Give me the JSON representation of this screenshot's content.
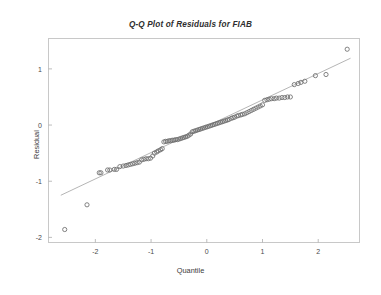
{
  "figure": {
    "title": "Q-Q Plot of Residuals for FIAB",
    "background_color": "#ffffff",
    "frame_color": "#c8c8c8",
    "marker_color": "#6d6d6d",
    "line_color": "#a8a8a8"
  },
  "axes": {
    "x_title": "Quantile",
    "y_title": "Residual",
    "x_ticks": [
      "-2",
      "-1",
      "0",
      "1",
      "2"
    ],
    "y_ticks": [
      "1",
      "0",
      "-1",
      "-2"
    ]
  },
  "chart_data": {
    "type": "scatter",
    "title": "Q-Q Plot of Residuals for FIAB",
    "xlabel": "Quantile",
    "ylabel": "Residual",
    "xlim": [
      -2.85,
      2.75
    ],
    "ylim": [
      -2.1,
      1.55
    ],
    "xticks": [
      -2,
      -1,
      0,
      1,
      2
    ],
    "yticks": [
      1,
      0,
      -1,
      -2
    ],
    "grid": false,
    "legend": null,
    "series": [
      {
        "name": "Residual quantiles",
        "marker": "open-circle",
        "x": [
          -2.55,
          -2.15,
          -1.93,
          -1.9,
          -1.78,
          -1.74,
          -1.66,
          -1.62,
          -1.56,
          -1.5,
          -1.45,
          -1.41,
          -1.37,
          -1.33,
          -1.29,
          -1.25,
          -1.21,
          -1.17,
          -1.13,
          -1.09,
          -1.05,
          -1.01,
          -0.97,
          -0.94,
          -0.9,
          -0.87,
          -0.83,
          -0.8,
          -0.77,
          -0.74,
          -0.71,
          -0.68,
          -0.65,
          -0.62,
          -0.59,
          -0.56,
          -0.53,
          -0.5,
          -0.47,
          -0.44,
          -0.41,
          -0.38,
          -0.35,
          -0.32,
          -0.29,
          -0.26,
          -0.23,
          -0.2,
          -0.17,
          -0.14,
          -0.11,
          -0.08,
          -0.05,
          -0.02,
          0.01,
          0.04,
          0.07,
          0.1,
          0.13,
          0.16,
          0.19,
          0.22,
          0.25,
          0.28,
          0.31,
          0.34,
          0.37,
          0.4,
          0.44,
          0.47,
          0.5,
          0.54,
          0.57,
          0.61,
          0.64,
          0.68,
          0.72,
          0.76,
          0.8,
          0.84,
          0.88,
          0.92,
          0.96,
          1.0,
          1.04,
          1.08,
          1.12,
          1.16,
          1.21,
          1.25,
          1.3,
          1.35,
          1.4,
          1.45,
          1.5,
          1.57,
          1.64,
          1.69,
          1.76,
          1.95,
          2.14,
          2.52
        ],
        "y": [
          -1.86,
          -1.42,
          -0.85,
          -0.85,
          -0.8,
          -0.8,
          -0.79,
          -0.79,
          -0.74,
          -0.73,
          -0.72,
          -0.71,
          -0.7,
          -0.69,
          -0.68,
          -0.67,
          -0.66,
          -0.62,
          -0.61,
          -0.6,
          -0.6,
          -0.59,
          -0.55,
          -0.5,
          -0.48,
          -0.46,
          -0.44,
          -0.42,
          -0.3,
          -0.29,
          -0.29,
          -0.28,
          -0.28,
          -0.27,
          -0.27,
          -0.26,
          -0.26,
          -0.25,
          -0.24,
          -0.23,
          -0.22,
          -0.21,
          -0.2,
          -0.18,
          -0.16,
          -0.12,
          -0.11,
          -0.1,
          -0.09,
          -0.08,
          -0.07,
          -0.06,
          -0.05,
          -0.04,
          -0.03,
          -0.02,
          -0.01,
          0.0,
          0.01,
          0.02,
          0.03,
          0.04,
          0.05,
          0.06,
          0.07,
          0.08,
          0.09,
          0.1,
          0.12,
          0.13,
          0.14,
          0.16,
          0.17,
          0.18,
          0.19,
          0.2,
          0.22,
          0.24,
          0.26,
          0.28,
          0.3,
          0.32,
          0.34,
          0.36,
          0.44,
          0.45,
          0.46,
          0.47,
          0.47,
          0.48,
          0.48,
          0.49,
          0.49,
          0.5,
          0.5,
          0.72,
          0.74,
          0.76,
          0.78,
          0.88,
          0.9,
          1.35
        ]
      }
    ],
    "reference_line": {
      "name": "normal reference line",
      "x": [
        -2.62,
        2.58
      ],
      "y": [
        -1.25,
        1.19
      ]
    }
  }
}
